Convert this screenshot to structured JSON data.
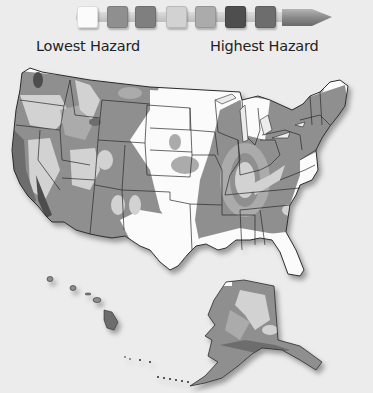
{
  "legend": {
    "low_label": "Lowest Hazard",
    "high_label": "Highest Hazard",
    "swatches": [
      {
        "level": 1,
        "color": "#fbfbfb"
      },
      {
        "level": 2,
        "color": "#8f8f8f"
      },
      {
        "level": 3,
        "color": "#7f7f7f"
      },
      {
        "level": 4,
        "color": "#d2d2d2"
      },
      {
        "level": 5,
        "color": "#ababab"
      },
      {
        "level": 6,
        "color": "#4e4e4e"
      },
      {
        "level": 7,
        "color": "#6d6d6d"
      }
    ],
    "arrow_color": "#8a8a8a"
  },
  "map": {
    "subject": "Seismic hazard map of the United States",
    "regions": [
      "contiguous-us",
      "alaska",
      "hawaii"
    ],
    "colors": {
      "background": "#ececec",
      "lowest": "#fbfbfb",
      "low": "#d2d2d2",
      "moderate": "#ababab",
      "high": "#8f8f8f",
      "very_high": "#6d6d6d",
      "highest": "#4e4e4e",
      "border": "#2a2a2a"
    }
  }
}
